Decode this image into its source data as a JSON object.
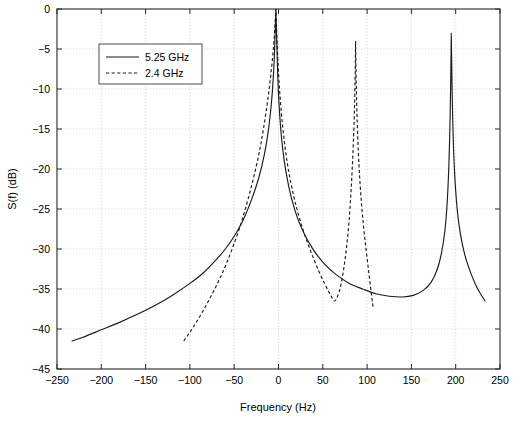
{
  "chart_data": {
    "type": "line",
    "title": "",
    "subtitle": "",
    "xlabel": "Frequency (Hz)",
    "ylabel": "S(f) (dB)",
    "xlim": [
      -250,
      250
    ],
    "ylim": [
      -45,
      0
    ],
    "xticks": [
      -250,
      -200,
      -150,
      -100,
      -50,
      0,
      50,
      100,
      150,
      200,
      250
    ],
    "xtick_labels": [
      "−250",
      "−200",
      "−150",
      "−100",
      "−50",
      "0",
      "50",
      "100",
      "150",
      "200",
      "250"
    ],
    "yticks": [
      0,
      -5,
      -10,
      -15,
      -20,
      -25,
      -30,
      -35,
      -40,
      -45
    ],
    "ytick_labels": [
      "0",
      "−5",
      "−10",
      "−15",
      "−20",
      "−25",
      "−30",
      "−35",
      "−40",
      "−45"
    ],
    "grid": true,
    "grid_style": "dotted",
    "legend_position": "upper-left-inset",
    "series": [
      {
        "name": "5.25 GHz",
        "style": "solid",
        "color": "#1a1a1a",
        "x_range": [
          -233,
          233
        ],
        "peaks": [
          {
            "x": -3,
            "y": 0
          },
          {
            "x": 195,
            "y": -3
          }
        ],
        "minima": [
          {
            "x": 140,
            "y": -36.0
          }
        ],
        "endpoints": [
          {
            "x": -233,
            "y": -41.5
          },
          {
            "x": 233,
            "y": -36.5
          }
        ],
        "points": [
          {
            "x": -233,
            "y": -41.5
          },
          {
            "x": -220,
            "y": -41.0
          },
          {
            "x": -200,
            "y": -40.1
          },
          {
            "x": -180,
            "y": -39.2
          },
          {
            "x": -160,
            "y": -38.2
          },
          {
            "x": -140,
            "y": -37.1
          },
          {
            "x": -120,
            "y": -35.8
          },
          {
            "x": -100,
            "y": -34.3
          },
          {
            "x": -85,
            "y": -33.0
          },
          {
            "x": -70,
            "y": -31.3
          },
          {
            "x": -60,
            "y": -30.0
          },
          {
            "x": -50,
            "y": -28.4
          },
          {
            "x": -40,
            "y": -26.4
          },
          {
            "x": -30,
            "y": -23.7
          },
          {
            "x": -22,
            "y": -21.0
          },
          {
            "x": -16,
            "y": -18.2
          },
          {
            "x": -12,
            "y": -15.6
          },
          {
            "x": -9,
            "y": -12.9
          },
          {
            "x": -7,
            "y": -10.4
          },
          {
            "x": -5.5,
            "y": -7.8
          },
          {
            "x": -4.5,
            "y": -5.4
          },
          {
            "x": -3.8,
            "y": -3.0
          },
          {
            "x": -3.2,
            "y": -1.0
          },
          {
            "x": -3.0,
            "y": 0.0
          },
          {
            "x": -2.8,
            "y": -1.0
          },
          {
            "x": -2.2,
            "y": -3.2
          },
          {
            "x": -1.5,
            "y": -6.0
          },
          {
            "x": -0.5,
            "y": -9.3
          },
          {
            "x": 1.0,
            "y": -12.6
          },
          {
            "x": 3.0,
            "y": -15.6
          },
          {
            "x": 6.0,
            "y": -18.6
          },
          {
            "x": 10.0,
            "y": -21.3
          },
          {
            "x": 15.0,
            "y": -23.8
          },
          {
            "x": 22.0,
            "y": -26.3
          },
          {
            "x": 30.0,
            "y": -28.3
          },
          {
            "x": 40.0,
            "y": -30.2
          },
          {
            "x": 52.0,
            "y": -31.9
          },
          {
            "x": 65.0,
            "y": -33.2
          },
          {
            "x": 80.0,
            "y": -34.3
          },
          {
            "x": 95.0,
            "y": -35.0
          },
          {
            "x": 110.0,
            "y": -35.6
          },
          {
            "x": 125.0,
            "y": -35.9
          },
          {
            "x": 140.0,
            "y": -36.0
          },
          {
            "x": 152.0,
            "y": -35.8
          },
          {
            "x": 163.0,
            "y": -35.2
          },
          {
            "x": 172.0,
            "y": -34.2
          },
          {
            "x": 179.0,
            "y": -32.6
          },
          {
            "x": 184.0,
            "y": -30.5
          },
          {
            "x": 188.0,
            "y": -27.5
          },
          {
            "x": 190.5,
            "y": -24.0
          },
          {
            "x": 192.3,
            "y": -19.5
          },
          {
            "x": 193.5,
            "y": -14.5
          },
          {
            "x": 194.3,
            "y": -9.5
          },
          {
            "x": 194.8,
            "y": -5.5
          },
          {
            "x": 195.0,
            "y": -3.0
          },
          {
            "x": 195.3,
            "y": -5.5
          },
          {
            "x": 195.9,
            "y": -9.8
          },
          {
            "x": 196.8,
            "y": -14.5
          },
          {
            "x": 198.2,
            "y": -19.2
          },
          {
            "x": 200.5,
            "y": -23.5
          },
          {
            "x": 203.5,
            "y": -26.8
          },
          {
            "x": 207.5,
            "y": -29.4
          },
          {
            "x": 212.0,
            "y": -31.4
          },
          {
            "x": 218.0,
            "y": -33.3
          },
          {
            "x": 224.0,
            "y": -34.8
          },
          {
            "x": 233.0,
            "y": -36.5
          }
        ]
      },
      {
        "name": "2.4 GHz",
        "style": "dashed",
        "color": "#1a1a1a",
        "x_range": [
          -107,
          107
        ],
        "peaks": [
          {
            "x": -3,
            "y": 0
          },
          {
            "x": 87,
            "y": -4
          }
        ],
        "minima": [
          {
            "x": 63,
            "y": -36.5
          }
        ],
        "endpoints": [
          {
            "x": -107,
            "y": -41.5
          },
          {
            "x": 107,
            "y": -37.5
          }
        ],
        "points": [
          {
            "x": -107,
            "y": -41.5
          },
          {
            "x": -100,
            "y": -40.4
          },
          {
            "x": -93,
            "y": -39.2
          },
          {
            "x": -86,
            "y": -37.9
          },
          {
            "x": -79,
            "y": -36.5
          },
          {
            "x": -72,
            "y": -35.0
          },
          {
            "x": -65,
            "y": -33.4
          },
          {
            "x": -58,
            "y": -31.6
          },
          {
            "x": -51,
            "y": -29.6
          },
          {
            "x": -44,
            "y": -27.4
          },
          {
            "x": -38,
            "y": -25.2
          },
          {
            "x": -32,
            "y": -22.8
          },
          {
            "x": -26,
            "y": -20.1
          },
          {
            "x": -21,
            "y": -17.5
          },
          {
            "x": -17,
            "y": -15.0
          },
          {
            "x": -13,
            "y": -12.1
          },
          {
            "x": -10,
            "y": -9.5
          },
          {
            "x": -7.5,
            "y": -7.0
          },
          {
            "x": -5.5,
            "y": -4.6
          },
          {
            "x": -4.2,
            "y": -2.4
          },
          {
            "x": -3.3,
            "y": -0.6
          },
          {
            "x": -3.0,
            "y": 0.0
          },
          {
            "x": -2.7,
            "y": -0.8
          },
          {
            "x": -2.0,
            "y": -3.0
          },
          {
            "x": -1.0,
            "y": -5.8
          },
          {
            "x": 0.5,
            "y": -8.9
          },
          {
            "x": 2.5,
            "y": -12.0
          },
          {
            "x": 5.0,
            "y": -15.0
          },
          {
            "x": 8.0,
            "y": -17.8
          },
          {
            "x": 12.0,
            "y": -20.6
          },
          {
            "x": 17.0,
            "y": -23.3
          },
          {
            "x": 22.0,
            "y": -25.5
          },
          {
            "x": 28.0,
            "y": -27.7
          },
          {
            "x": 34.0,
            "y": -29.6
          },
          {
            "x": 40.0,
            "y": -31.3
          },
          {
            "x": 46.0,
            "y": -32.9
          },
          {
            "x": 52.0,
            "y": -34.3
          },
          {
            "x": 57.0,
            "y": -35.4
          },
          {
            "x": 61.0,
            "y": -36.2
          },
          {
            "x": 63.0,
            "y": -36.5
          },
          {
            "x": 65.0,
            "y": -36.3
          },
          {
            "x": 68.0,
            "y": -35.5
          },
          {
            "x": 71.0,
            "y": -34.2
          },
          {
            "x": 74.0,
            "y": -32.2
          },
          {
            "x": 77.0,
            "y": -29.6
          },
          {
            "x": 79.5,
            "y": -26.7
          },
          {
            "x": 81.5,
            "y": -23.4
          },
          {
            "x": 83.2,
            "y": -20.0
          },
          {
            "x": 84.6,
            "y": -16.4
          },
          {
            "x": 85.7,
            "y": -12.7
          },
          {
            "x": 86.4,
            "y": -9.0
          },
          {
            "x": 86.8,
            "y": -6.2
          },
          {
            "x": 87.0,
            "y": -4.0
          },
          {
            "x": 87.3,
            "y": -6.4
          },
          {
            "x": 87.9,
            "y": -10.2
          },
          {
            "x": 88.8,
            "y": -14.0
          },
          {
            "x": 90.0,
            "y": -17.6
          },
          {
            "x": 91.6,
            "y": -21.0
          },
          {
            "x": 93.6,
            "y": -24.2
          },
          {
            "x": 96.0,
            "y": -27.2
          },
          {
            "x": 99.0,
            "y": -30.2
          },
          {
            "x": 102.0,
            "y": -33.0
          },
          {
            "x": 105.0,
            "y": -35.8
          },
          {
            "x": 107.0,
            "y": -37.5
          }
        ]
      }
    ],
    "legend": [
      {
        "label": "5.25 GHz",
        "style": "solid"
      },
      {
        "label": "2.4 GHz",
        "style": "dashed"
      }
    ]
  }
}
